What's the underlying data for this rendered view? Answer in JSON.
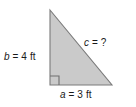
{
  "figure": {
    "type": "right-triangle-diagram",
    "background_color": "#ffffff",
    "width": 136,
    "height": 107
  },
  "triangle": {
    "name": "right-triangle",
    "fill_color": "#cacaca",
    "stroke_color": "#7a7a7a",
    "stroke_width": 1,
    "vertices": {
      "apex": [
        50,
        10
      ],
      "right_angle": [
        50,
        85
      ],
      "base_right": [
        112,
        85
      ]
    },
    "right_angle_marker": {
      "size": 9,
      "stroke_color": "#6f6f6f"
    }
  },
  "labels": {
    "leg_vertical": {
      "name": "label-b",
      "variable": "b",
      "rest": " = 4 ft",
      "full_text": "b = 4 ft",
      "value": 4,
      "unit": "ft"
    },
    "hypotenuse": {
      "name": "label-c",
      "variable": "c",
      "rest": " = ?",
      "full_text": "c = ?",
      "value": null,
      "unit": ""
    },
    "leg_horizontal": {
      "name": "label-a",
      "variable": "a",
      "rest": " = 3 ft",
      "full_text": "a = 3 ft",
      "value": 3,
      "unit": "ft"
    }
  },
  "colors": {
    "text": "#1a1a1a",
    "fill": "#cacaca",
    "stroke": "#7a7a7a",
    "background": "#ffffff"
  }
}
